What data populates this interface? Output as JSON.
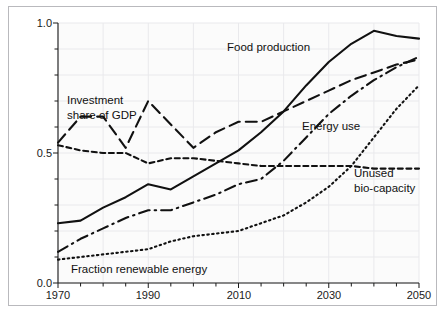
{
  "figure": {
    "background_color": "#ffffff",
    "frame_color": "#b9b9bd",
    "plot_background_color": "#fbfbfb",
    "grid_color": "#e9e9ec",
    "line_color": "#111111"
  },
  "chart_data": {
    "type": "line",
    "title": "",
    "subtitle": "",
    "xlabel": "",
    "ylabel": "",
    "xlim": [
      1970,
      2050
    ],
    "ylim": [
      0.0,
      1.0
    ],
    "grid": true,
    "legend_position": "inline-annotations",
    "x_ticks_major": [
      1970,
      1990,
      2010,
      2030,
      2050
    ],
    "x_tick_labels": [
      "1970",
      "1990",
      "2010",
      "2030",
      "2050"
    ],
    "x_ticks_minor_step": 5,
    "y_ticks_major": [
      0.0,
      0.5,
      1.0
    ],
    "y_tick_labels": [
      "0.0",
      "0.5",
      "1.0"
    ],
    "y_ticks_minor_step": 0.1,
    "x": [
      1970,
      1975,
      1980,
      1985,
      1990,
      1995,
      2000,
      2005,
      2010,
      2015,
      2020,
      2025,
      2030,
      2035,
      2040,
      2045,
      2050
    ],
    "series": [
      {
        "name": "Food production",
        "label": "Food production",
        "style": "solid",
        "values": [
          0.23,
          0.24,
          0.29,
          0.33,
          0.38,
          0.36,
          0.41,
          0.46,
          0.51,
          0.58,
          0.66,
          0.76,
          0.85,
          0.92,
          0.97,
          0.95,
          0.94
        ],
        "label_x": 2018,
        "label_y": 0.9
      },
      {
        "name": "Investment share of GDP",
        "label": "Investment share of GDP",
        "style": "dashed-long",
        "values": [
          0.54,
          0.64,
          0.64,
          0.52,
          0.7,
          0.61,
          0.52,
          0.58,
          0.62,
          0.62,
          0.66,
          0.7,
          0.74,
          0.78,
          0.81,
          0.84,
          0.86
        ],
        "label_x": 1981,
        "label_y": 0.735
      },
      {
        "name": "Energy use",
        "label": "Energy use",
        "style": "dash-dot",
        "values": [
          0.12,
          0.17,
          0.21,
          0.25,
          0.28,
          0.28,
          0.31,
          0.34,
          0.38,
          0.4,
          0.47,
          0.56,
          0.65,
          0.72,
          0.78,
          0.83,
          0.87
        ],
        "label_x": 2024,
        "label_y": 0.615
      },
      {
        "name": "Unused bio-capacity",
        "label": "Unused bio-capacity",
        "style": "dotted",
        "values": [
          0.09,
          0.1,
          0.11,
          0.12,
          0.13,
          0.16,
          0.18,
          0.19,
          0.2,
          0.23,
          0.26,
          0.31,
          0.37,
          0.45,
          0.56,
          0.67,
          0.76
        ],
        "label_x": 2036,
        "label_y": 0.395
      },
      {
        "name": "Fraction renewable energy",
        "label": "Fraction renewable energy",
        "style": "dashed-short",
        "values": [
          0.53,
          0.51,
          0.5,
          0.5,
          0.46,
          0.48,
          0.48,
          0.47,
          0.46,
          0.45,
          0.45,
          0.45,
          0.45,
          0.45,
          0.44,
          0.44,
          0.44
        ],
        "label_x": 1976,
        "label_y": 0.075
      }
    ],
    "annotations": [
      {
        "id": "food-production",
        "text": "Food production"
      },
      {
        "id": "investment-share-of-gdp",
        "text_line1": "Investment",
        "text_line2": "share of GDP"
      },
      {
        "id": "energy-use",
        "text": "Energy use"
      },
      {
        "id": "unused-bio-capacity",
        "text_line1": "Unused",
        "text_line2": "bio-capacity"
      },
      {
        "id": "fraction-renewable-energy",
        "text": "Fraction renewable energy"
      }
    ]
  },
  "labels": {
    "y_1_0": "1.0",
    "y_0_5": "0.5",
    "y_0_0": "0.0",
    "x_1970": "1970",
    "x_1990": "1990",
    "x_2010": "2010",
    "x_2030": "2030",
    "x_2050": "2050",
    "ann_food_production": "Food production",
    "ann_investment_line1": "Investment",
    "ann_investment_line2": "share of GDP",
    "ann_energy_use": "Energy use",
    "ann_unused_line1": "Unused",
    "ann_unused_line2": "bio-capacity",
    "ann_fraction_renewable": "Fraction renewable energy"
  }
}
